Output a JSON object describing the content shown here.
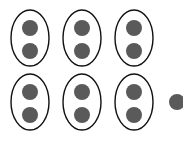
{
  "diagram": {
    "colors": {
      "dot": "#5a5a5a",
      "oval_stroke": "#111111",
      "background": "#ffffff"
    },
    "group_size": 2,
    "group_count": 6,
    "remainder": 1,
    "groups": [
      {
        "cx": 30,
        "cy": 38,
        "dots": [
          {
            "cy": 28
          },
          {
            "cy": 51
          }
        ]
      },
      {
        "cx": 82,
        "cy": 38,
        "dots": [
          {
            "cy": 28
          },
          {
            "cy": 51
          }
        ]
      },
      {
        "cx": 134,
        "cy": 38,
        "dots": [
          {
            "cy": 28
          },
          {
            "cy": 51
          }
        ]
      },
      {
        "cx": 30,
        "cy": 102,
        "dots": [
          {
            "cy": 92
          },
          {
            "cy": 115
          }
        ]
      },
      {
        "cx": 82,
        "cy": 102,
        "dots": [
          {
            "cy": 92
          },
          {
            "cy": 115
          }
        ]
      },
      {
        "cx": 134,
        "cy": 102,
        "dots": [
          {
            "cy": 92
          },
          {
            "cy": 115
          }
        ]
      }
    ],
    "loose_dots": [
      {
        "cx": 177,
        "cy": 102
      }
    ]
  }
}
